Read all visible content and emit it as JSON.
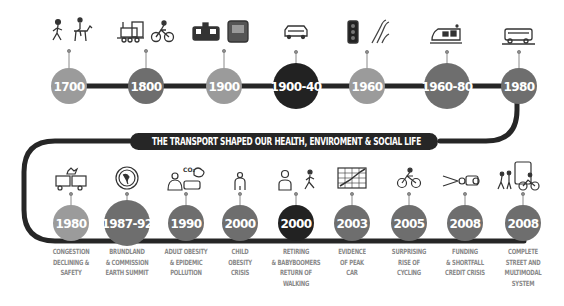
{
  "banner": {
    "text": "THE TRANSPORT SHAPED OUR HEALTH, ENVIROMENT & SOCIAL LIFE"
  },
  "colors": {
    "line": "#262626",
    "light": "#9b9b9b",
    "mid": "#6e6e6e",
    "dark": "#222222",
    "label": "#8a8a8a"
  },
  "top_row": [
    {
      "year": "1700",
      "icons": [
        "walking-person-icon",
        "horse-rider-icon"
      ],
      "shade": "light"
    },
    {
      "year": "1800",
      "icons": [
        "steam-train-icon",
        "bicycle-icon"
      ],
      "shade": "mid"
    },
    {
      "year": "1900",
      "icons": [
        "tram-icon",
        "subway-icon"
      ],
      "shade": "light"
    },
    {
      "year": "1900-40",
      "icons": [
        "car-icon"
      ],
      "shade": "dark"
    },
    {
      "year": "1960",
      "icons": [
        "traffic-light-icon",
        "highway-icon"
      ],
      "shade": "light"
    },
    {
      "year": "1960-80",
      "icons": [
        "light-rail-icon"
      ],
      "shade": "mid"
    },
    {
      "year": "1980",
      "icons": [
        "bus-icon"
      ],
      "shade": "mid"
    }
  ],
  "bottom_row": [
    {
      "year": "1980",
      "label": [
        "CONGESTION",
        "DECLINING &",
        "SAFETY"
      ],
      "icons": [
        "car-crash-icon"
      ],
      "shade": "light"
    },
    {
      "year": "1987-92",
      "label": [
        "BRUNDLAND",
        "& COMMISSION",
        "EARTH SUMMIT"
      ],
      "icons": [
        "un-globe-icon"
      ],
      "shade": "mid"
    },
    {
      "year": "1990",
      "label": [
        "ADULT OBESITY",
        "& EPIDEMIC",
        "POLLUTION"
      ],
      "icons": [
        "obese-person-co2-car-icon"
      ],
      "shade": "mid"
    },
    {
      "year": "2000",
      "label": [
        "CHILD",
        "OBESITY",
        "CRISIS"
      ],
      "icons": [
        "child-icon"
      ],
      "shade": "mid"
    },
    {
      "year": "2000",
      "label": [
        "RETIRING",
        "& BABYBOOMERS",
        "RETURN OF",
        "WALKING"
      ],
      "icons": [
        "elderly-person-icon",
        "walker-icon"
      ],
      "shade": "dark"
    },
    {
      "year": "2003",
      "label": [
        "EVIDENCE",
        "OF PEAK",
        "CAR"
      ],
      "icons": [
        "peak-chart-icon"
      ],
      "shade": "mid"
    },
    {
      "year": "2005",
      "label": [
        "SURPRISING",
        "RISE OF",
        "CYCLING"
      ],
      "icons": [
        "cyclist-icon"
      ],
      "shade": "mid"
    },
    {
      "year": "2008",
      "label": [
        "FUNDING",
        "& SHORTFALL",
        "CREDIT CRISIS"
      ],
      "icons": [
        "scissors-money-icon"
      ],
      "shade": "mid"
    },
    {
      "year": "2008",
      "label": [
        "COMPLETE",
        "STREET AND",
        "MULTIMODAL",
        "SYSTEM"
      ],
      "icons": [
        "multimodal-street-icon"
      ],
      "shade": "mid"
    }
  ]
}
